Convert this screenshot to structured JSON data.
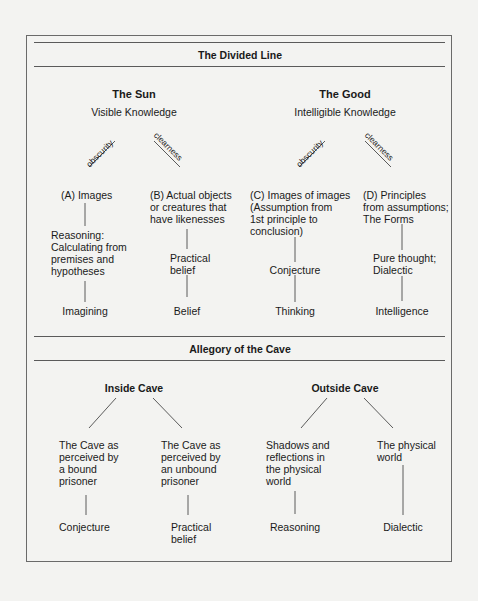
{
  "divided_line": {
    "title": "The Divided Line",
    "sun": {
      "title": "The Sun",
      "subtitle": "Visible Knowledge"
    },
    "good": {
      "title": "The Good",
      "subtitle": "Intelligible Knowledge"
    },
    "edge_labels": {
      "left": "obscurity",
      "right": "clearness"
    },
    "columns": [
      {
        "head": [
          "(A) Images"
        ],
        "middle": [
          "Reasoning:",
          "Calculating from",
          "premises and",
          "hypotheses"
        ],
        "bottom": "Imagining"
      },
      {
        "head": [
          "(B) Actual objects",
          "or creatures that",
          "have likenesses"
        ],
        "middle": [
          "Practical",
          "belief"
        ],
        "bottom": "Belief"
      },
      {
        "head": [
          "(C) Images of images",
          "(Assumption from",
          "1st principle to",
          "conclusion)"
        ],
        "middle": [
          "Conjecture"
        ],
        "bottom": "Thinking"
      },
      {
        "head": [
          "(D) Principles",
          "from assumptions;",
          "The Forms"
        ],
        "middle": [
          "Pure thought;",
          "Dialectic"
        ],
        "bottom": "Intelligence"
      }
    ]
  },
  "cave": {
    "title": "Allegory of the Cave",
    "inside": "Inside Cave",
    "outside": "Outside Cave",
    "columns": [
      {
        "head": [
          "The Cave as",
          "perceived by",
          "a bound",
          "prisoner"
        ],
        "bottom": [
          "Conjecture"
        ]
      },
      {
        "head": [
          "The Cave as",
          "perceived by",
          "an unbound",
          "prisoner"
        ],
        "bottom": [
          "Practical",
          "belief"
        ]
      },
      {
        "head": [
          "Shadows and",
          "reflections in",
          "the physical",
          "world"
        ],
        "bottom": [
          "Reasoning"
        ]
      },
      {
        "head": [
          "The physical",
          "world"
        ],
        "bottom": [
          "Dialectic"
        ]
      }
    ]
  },
  "colors": {
    "background": "#f3f3f1",
    "line": "#4a4a4a",
    "text": "#1a1a1a"
  }
}
